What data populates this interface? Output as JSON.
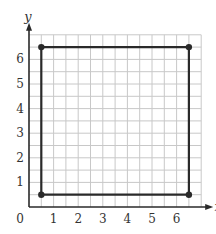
{
  "chart_data": {
    "type": "line",
    "title": "",
    "xlabel": "x",
    "ylabel": "y",
    "xlim": [
      0,
      7
    ],
    "ylim": [
      0,
      7
    ],
    "x_ticks": [
      "1",
      "2",
      "3",
      "4",
      "5",
      "6"
    ],
    "y_ticks": [
      "1",
      "2",
      "3",
      "4",
      "5",
      "6"
    ],
    "origin_label": "0",
    "grid": true,
    "grid_step": 0.5,
    "series": [
      {
        "name": "square",
        "closed": true,
        "points": [
          [
            0.5,
            0.5
          ],
          [
            6.5,
            0.5
          ],
          [
            6.5,
            6.5
          ],
          [
            0.5,
            6.5
          ]
        ]
      }
    ]
  },
  "colors": {
    "grid": "#c8c8c8",
    "axis": "#2a2a2a",
    "shape": "#2a2a2a",
    "text": "#333333"
  }
}
